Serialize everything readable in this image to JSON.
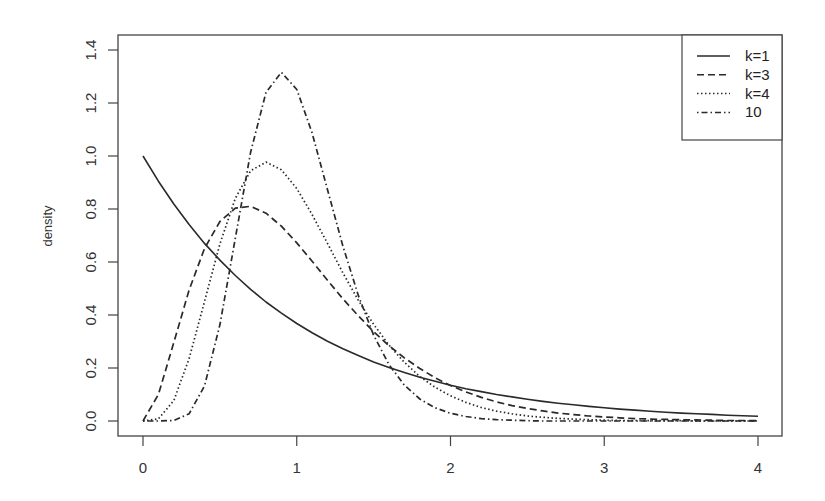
{
  "chart_data": {
    "type": "line",
    "title": "",
    "xlabel": "",
    "ylabel": "density",
    "xlim": [
      0,
      4
    ],
    "ylim": [
      0,
      1.4
    ],
    "x_ticks": [
      "0",
      "1",
      "2",
      "3",
      "4"
    ],
    "y_ticks": [
      "0.0",
      "0.2",
      "0.4",
      "0.6",
      "0.8",
      "1.0",
      "1.2",
      "1.4"
    ],
    "grid": false,
    "legend_position": "top-right",
    "x": [
      0,
      0.1,
      0.2,
      0.3,
      0.4,
      0.5,
      0.6,
      0.7,
      0.8,
      0.9,
      1.0,
      1.1,
      1.2,
      1.3,
      1.4,
      1.5,
      1.6,
      1.7,
      1.8,
      1.9,
      2.0,
      2.1,
      2.2,
      2.3,
      2.4,
      2.5,
      2.6,
      2.7,
      2.8,
      2.9,
      3.0,
      3.1,
      3.2,
      3.3,
      3.4,
      3.5,
      3.6,
      3.7,
      3.8,
      3.9,
      4.0
    ],
    "series": [
      {
        "name": "k=1",
        "style": "solid",
        "values": [
          1.0,
          0.905,
          0.819,
          0.741,
          0.67,
          0.607,
          0.549,
          0.497,
          0.449,
          0.407,
          0.368,
          0.333,
          0.301,
          0.273,
          0.247,
          0.223,
          0.202,
          0.183,
          0.165,
          0.15,
          0.135,
          0.122,
          0.111,
          0.1,
          0.091,
          0.082,
          0.074,
          0.067,
          0.061,
          0.055,
          0.05,
          0.045,
          0.041,
          0.037,
          0.033,
          0.03,
          0.027,
          0.025,
          0.022,
          0.02,
          0.018
        ]
      },
      {
        "name": "k=3",
        "style": "dashed",
        "values": [
          0,
          0.1,
          0.296,
          0.494,
          0.651,
          0.753,
          0.803,
          0.81,
          0.784,
          0.735,
          0.672,
          0.603,
          0.531,
          0.461,
          0.397,
          0.337,
          0.284,
          0.238,
          0.198,
          0.163,
          0.134,
          0.11,
          0.089,
          0.072,
          0.058,
          0.047,
          0.038,
          0.03,
          0.024,
          0.019,
          0.015,
          0.012,
          0.009,
          0.007,
          0.006,
          0.005,
          0.004,
          0.003,
          0.002,
          0.002,
          0.001
        ]
      },
      {
        "name": "k=4",
        "style": "dotted",
        "values": [
          0,
          0.008,
          0.077,
          0.235,
          0.451,
          0.668,
          0.84,
          0.944,
          0.977,
          0.948,
          0.877,
          0.779,
          0.67,
          0.559,
          0.456,
          0.365,
          0.286,
          0.221,
          0.168,
          0.127,
          0.095,
          0.07,
          0.051,
          0.037,
          0.027,
          0.019,
          0.014,
          0.01,
          0.007,
          0.005,
          0.003,
          0.002,
          0.002,
          0.001,
          0.001,
          0.001,
          0,
          0,
          0,
          0,
          0
        ]
      },
      {
        "name": "10",
        "style": "dotdash",
        "values": [
          0,
          0,
          0.002,
          0.027,
          0.132,
          0.363,
          0.689,
          1.014,
          1.24,
          1.316,
          1.251,
          1.087,
          0.873,
          0.66,
          0.474,
          0.324,
          0.213,
          0.135,
          0.083,
          0.05,
          0.029,
          0.017,
          0.009,
          0.005,
          0.003,
          0.001,
          0,
          0,
          0,
          0,
          0,
          0,
          0,
          0,
          0,
          0,
          0,
          0,
          0,
          0,
          0
        ]
      }
    ]
  },
  "legend": {
    "items": [
      {
        "label": "k=1",
        "style": "solid"
      },
      {
        "label": "k=3",
        "style": "dashed"
      },
      {
        "label": "k=4",
        "style": "dotted"
      },
      {
        "label": "10",
        "style": "dotdash"
      }
    ]
  },
  "colors": {
    "line": "#2a2a2a",
    "axis": "#444444",
    "text": "#333333",
    "background": "#ffffff"
  }
}
